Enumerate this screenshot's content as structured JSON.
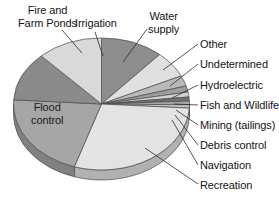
{
  "chart_data": {
    "type": "pie",
    "title": "",
    "subtitle": "",
    "xlabel": "",
    "ylabel": "",
    "legend_position": "callout-labels",
    "grid": false,
    "three_d": true,
    "start_angle_deg": 0,
    "direction": "clockwise",
    "categories": [
      "Water supply",
      "Other",
      "Undetermined",
      "Hydroelectric",
      "Fish and Wildlife",
      "Mining (tailings)",
      "Debris control",
      "Navigation",
      "Recreation",
      "Flood control",
      "Fire and Farm Ponds",
      "Irrigation"
    ],
    "values": [
      11.5,
      6.5,
      2.6,
      1.5,
      1.2,
      1.0,
      0.9,
      0.8,
      29.0,
      21.0,
      12.0,
      12.0
    ],
    "colors": [
      "#8d8d8d",
      "#e0e0e0",
      "#b9b9b9",
      "#9d9d9d",
      "#d2d2d2",
      "#6f6f6f",
      "#a8a8a8",
      "#c6c6c6",
      "#e3e3e3",
      "#a6a6a6",
      "#8a8a8a",
      "#d9d9d9"
    ],
    "labels": [
      {
        "name": "fire-and-farm-ponds",
        "text": "Fire and\nFarm Ponds"
      },
      {
        "name": "irrigation",
        "text": "Irrigation"
      },
      {
        "name": "water-supply",
        "text": "Water\nsupply"
      },
      {
        "name": "other",
        "text": "Other"
      },
      {
        "name": "undetermined",
        "text": "Undetermined"
      },
      {
        "name": "hydroelectric",
        "text": "Hydroelectric"
      },
      {
        "name": "fish-and-wildlife",
        "text": "Fish and Wildlife"
      },
      {
        "name": "mining-tailings",
        "text": "Mining (tailings)"
      },
      {
        "name": "debris-control",
        "text": "Debris control"
      },
      {
        "name": "navigation",
        "text": "Navigation"
      },
      {
        "name": "recreation",
        "text": "Recreation"
      },
      {
        "name": "flood-control",
        "text": "Flood\ncontrol"
      }
    ]
  },
  "labels": {
    "fire_and_farm_ponds": "Fire and\nFarm Ponds",
    "irrigation": "Irrigation",
    "water_supply": "Water\nsupply",
    "other": "Other",
    "undetermined": "Undetermined",
    "hydroelectric": "Hydroelectric",
    "fish_and_wildlife": "Fish and Wildlife",
    "mining_tailings": "Mining (tailings)",
    "debris_control": "Debris control",
    "navigation": "Navigation",
    "recreation": "Recreation",
    "flood_control": "Flood\ncontrol"
  }
}
